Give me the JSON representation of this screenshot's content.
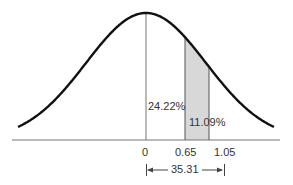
{
  "chart_data": {
    "type": "area",
    "title": "",
    "xlabel": "",
    "ylabel": "",
    "tick_labels": [
      "0",
      "0.65",
      "1.05"
    ],
    "ticks": [
      0,
      0.65,
      1.05
    ],
    "regions": [
      {
        "from": 0,
        "to": 0.65,
        "label": "24.22%",
        "value": 24.22,
        "shaded": false
      },
      {
        "from": 0.65,
        "to": 1.05,
        "label": "11.09%",
        "value": 11.09,
        "shaded": true
      }
    ],
    "span_annotation": {
      "from": 0,
      "to": 1.05,
      "label": "35.31"
    },
    "colors": {
      "curve": "#111111",
      "shade": "#d8d8d8",
      "axis": "#777777"
    },
    "grid": false,
    "legend": "none"
  },
  "labels": {
    "region1": "24.22%",
    "region2": "11.09%",
    "tick0": "0",
    "tick1": "0.65",
    "tick2": "1.05",
    "span": "35.31"
  }
}
